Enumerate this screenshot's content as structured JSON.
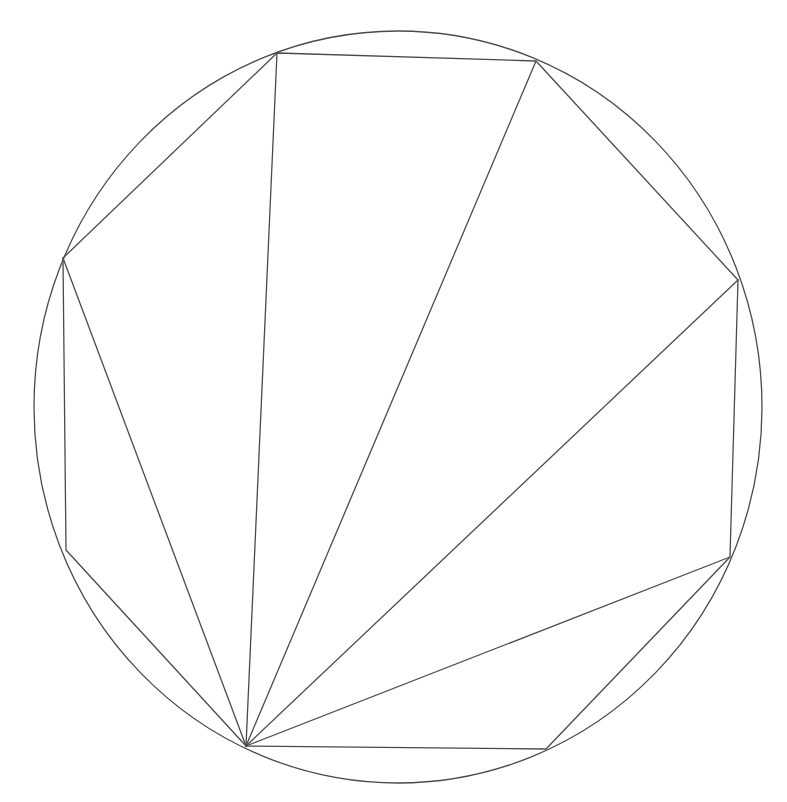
{
  "diagram": {
    "title": "",
    "type": "inscribed-octagon-fan-triangulation",
    "background": "#ffffff",
    "stroke_color": "#4a4a4a",
    "circle": {
      "cx": 398,
      "cy": 407,
      "rx": 364,
      "ry": 376
    },
    "vertices": [
      {
        "id": "A",
        "x": 277,
        "y": 53
      },
      {
        "id": "B",
        "x": 536,
        "y": 61
      },
      {
        "id": "C",
        "x": 738,
        "y": 280
      },
      {
        "id": "D",
        "x": 730,
        "y": 557
      },
      {
        "id": "E",
        "x": 546,
        "y": 749
      },
      {
        "id": "F",
        "x": 246,
        "y": 746
      },
      {
        "id": "G",
        "x": 66,
        "y": 550
      },
      {
        "id": "H",
        "x": 63,
        "y": 258
      }
    ],
    "polygon_order": [
      "A",
      "B",
      "C",
      "D",
      "E",
      "F",
      "G",
      "H"
    ],
    "fan_apex": "F",
    "diagonals": [
      [
        "F",
        "H"
      ],
      [
        "F",
        "A"
      ],
      [
        "F",
        "B"
      ],
      [
        "F",
        "C"
      ],
      [
        "F",
        "D"
      ]
    ]
  }
}
